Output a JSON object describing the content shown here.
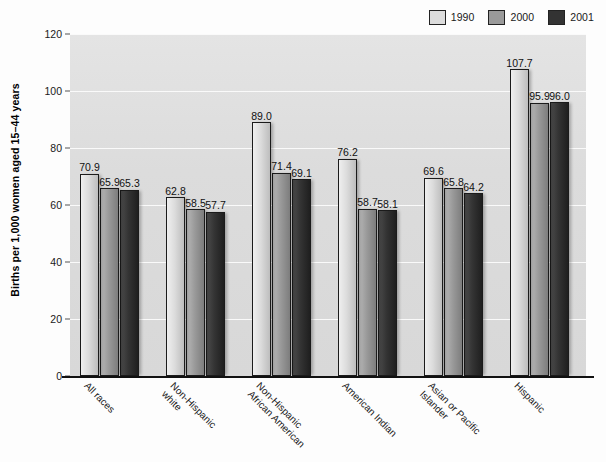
{
  "chart_data": {
    "type": "bar",
    "title": "",
    "xlabel": "",
    "ylabel": "Births per 1,000 women aged 15–44 years",
    "ylim": [
      0,
      120
    ],
    "yticks": [
      0,
      20,
      40,
      60,
      80,
      100,
      120
    ],
    "grid": true,
    "legend_position": "top-right",
    "categories": [
      "All races",
      "Non-Hispanic\nwhite",
      "Non-Hispanic\nAfrican American",
      "American Indian",
      "Asian or Pacific\nIslander",
      "Hispanic"
    ],
    "series": [
      {
        "name": "1990",
        "color": "#dcdcdc",
        "values": [
          70.9,
          62.8,
          89.0,
          76.2,
          69.6,
          107.7
        ],
        "labels": [
          "70.9",
          "62.8",
          "89.0",
          "76.2",
          "69.6",
          "107.7"
        ]
      },
      {
        "name": "2000",
        "color": "#9a9a9a",
        "values": [
          65.9,
          58.5,
          71.4,
          58.7,
          65.8,
          95.9
        ],
        "labels": [
          "65.9",
          "58.5",
          "71.4",
          "58.7",
          "65.8",
          "95.9"
        ]
      },
      {
        "name": "2001",
        "color": "#333333",
        "values": [
          65.3,
          57.7,
          69.1,
          58.1,
          64.2,
          96.0
        ],
        "labels": [
          "65.3",
          "57.7",
          "69.1",
          "58.1",
          "64.2",
          "96.0"
        ]
      }
    ]
  },
  "legend": {
    "items": [
      {
        "label": "1990",
        "color": "#dcdcdc"
      },
      {
        "label": "2000",
        "color": "#9a9a9a"
      },
      {
        "label": "2001",
        "color": "#333333"
      }
    ]
  },
  "axes": {
    "y_title": "Births per 1,000 women aged 15–44 years",
    "y_tick_labels": [
      "0",
      "20",
      "40",
      "60",
      "80",
      "100",
      "120"
    ]
  }
}
